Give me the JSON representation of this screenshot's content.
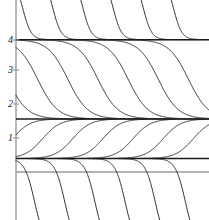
{
  "figure": {
    "title": "",
    "background_color": "#ffffff",
    "width": 209,
    "height": 220
  },
  "axes": {
    "axis_color": "#9a9a9a",
    "curve_color": "#2b2b2b",
    "equilibrium_color": "#1a1a1a",
    "y_axis_x_px": 16,
    "zero_line_y_px": 172,
    "y_tick_labels": [
      "4",
      "3",
      "2",
      "1"
    ],
    "y_tick_values": [
      4,
      3,
      2,
      1
    ],
    "y_tick_y_px": [
      40,
      70,
      104,
      138
    ],
    "x_tick_labels": [],
    "grid": false,
    "xlim": [
      0,
      6.4
    ],
    "ylim": [
      -0.55,
      5.0
    ]
  },
  "chart_data": {
    "type": "line",
    "title": "",
    "xlabel": "",
    "ylabel": "",
    "xlim": [
      0,
      6.4
    ],
    "ylim": [
      -0.55,
      5.0
    ],
    "grid": false,
    "legend": "none",
    "equilibria": [
      {
        "y": 4,
        "label": "4",
        "stability": "semi-stable-from-above"
      },
      {
        "y": 2,
        "label": "2",
        "stability": "stable"
      },
      {
        "y": 1,
        "label": "1",
        "stability": "unstable"
      }
    ],
    "series": [
      {
        "name": "above-4-decreasing",
        "band": [
          4,
          5
        ],
        "direction": "decreasing toward 4",
        "count": 6,
        "x_starts": [
          1.0,
          2.0,
          3.0,
          4.0,
          5.0,
          6.0
        ]
      },
      {
        "name": "between-2-and-4-decreasing",
        "band": [
          2,
          4
        ],
        "direction": "decreasing from 4 toward 2",
        "count": 7,
        "x_starts": [
          0.0,
          1.0,
          2.0,
          3.0,
          4.0,
          5.0,
          6.0
        ]
      },
      {
        "name": "between-1-and-2-increasing",
        "band": [
          1,
          2
        ],
        "direction": "increasing from 1 toward 2",
        "count": 7,
        "x_starts": [
          0.0,
          1.0,
          2.0,
          3.0,
          4.0,
          5.0,
          6.0
        ]
      },
      {
        "name": "below-1-decreasing",
        "band": [
          -0.6,
          1
        ],
        "direction": "decreasing away from 1",
        "count": 6,
        "x_starts": [
          1.0,
          2.0,
          3.0,
          4.0,
          5.0,
          6.0
        ]
      }
    ],
    "tick_values": [
      1,
      2,
      3,
      4
    ],
    "tick_labels": [
      "1",
      "2",
      "3",
      "4"
    ]
  }
}
